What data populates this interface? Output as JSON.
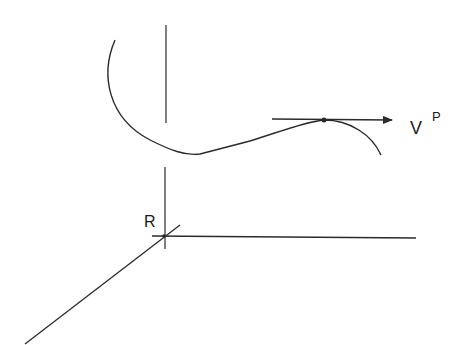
{
  "diagram": {
    "labels": {
      "origin": "R",
      "vector_main": "V",
      "vector_sup": "P"
    },
    "colors": {
      "stroke": "#2a2a2a",
      "background": "#ffffff"
    },
    "elements": [
      "vertical-axis",
      "horizontal-axis",
      "diagonal-axis",
      "trajectory-curve",
      "tangent-velocity-arrow",
      "point-P"
    ]
  }
}
